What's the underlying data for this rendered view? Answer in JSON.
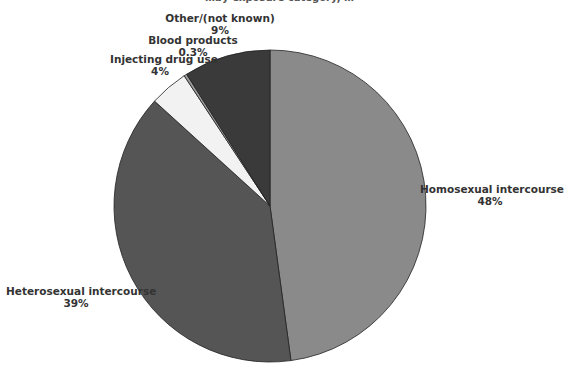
{
  "chart_data": {
    "type": "pie",
    "title": "…by exposure category, …",
    "start_angle_deg": 0,
    "direction": "clockwise",
    "slices": [
      {
        "label": "Homosexual intercourse",
        "value": 48,
        "value_label": "48%",
        "color": "#8a8a8a"
      },
      {
        "label": "Heterosexual intercourse",
        "value": 39,
        "value_label": "39%",
        "color": "#555555"
      },
      {
        "label": "Injecting drug use",
        "value": 4,
        "value_label": "4%",
        "color": "#f2f2f2"
      },
      {
        "label": "Blood products",
        "value": 0.3,
        "value_label": "0.3%",
        "color": "#9a9a9a"
      },
      {
        "label": "Other/(not known)",
        "value": 9,
        "value_label": "9%",
        "color": "#3a3a3a"
      }
    ]
  }
}
